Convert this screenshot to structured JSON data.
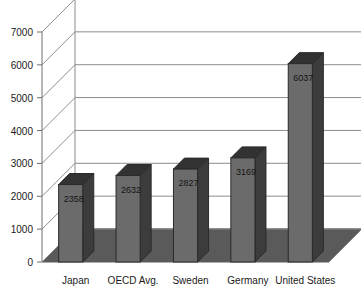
{
  "chart_data": {
    "type": "bar",
    "title": "",
    "subtitle": "",
    "xlabel": "",
    "ylabel": "",
    "categories": [
      "Japan",
      "OECD Avg.",
      "Sweden",
      "Germany",
      "United States"
    ],
    "values": [
      2358,
      2632,
      2827,
      3169,
      6037
    ],
    "value_labels": [
      "2358",
      "2632",
      "2827",
      "3169",
      "6037"
    ],
    "ylim": [
      0,
      7000
    ],
    "yticks": [
      0,
      1000,
      2000,
      3000,
      4000,
      5000,
      6000,
      7000
    ],
    "ytick_labels": [
      "0",
      "1000",
      "2000",
      "3000",
      "4000",
      "5000",
      "6000",
      "7000"
    ],
    "grid": true,
    "legend": null,
    "style": "3d-column",
    "colors": {
      "bar_front": "#6b6b6b",
      "bar_side": "#3c3c3c",
      "bar_top": "#323232",
      "floor": "#5a5a5a",
      "wall": "#ffffff",
      "grid_line": "#8c8c8c",
      "axis": "#6e6e6e",
      "text": "#1a1a1a"
    }
  }
}
